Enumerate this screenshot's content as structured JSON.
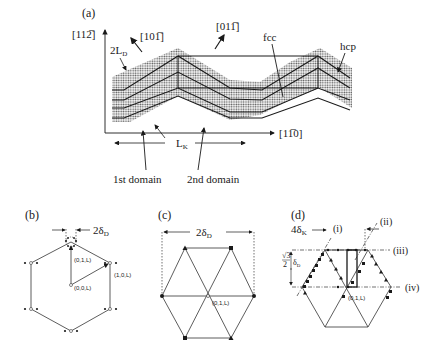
{
  "figure": {
    "panel_a": {
      "label": "(a)",
      "axis_y": "[11ŷ2]",
      "axis_y_display": "[112̅]",
      "axis_x_display": "[11̅0]",
      "dir_10_1": "[101̅]",
      "dir_01_1": "[011̅]",
      "label_2LD": "2L",
      "label_2LD_sub": "D",
      "label_fcc": "fcc",
      "label_hcp": "hcp",
      "label_LK": "L",
      "label_LK_sub": "K",
      "label_1st": "1st domain",
      "label_2nd": "2nd domain",
      "colors": {
        "band": "#8a8a8a",
        "line": "#1a1a1a"
      }
    },
    "panel_b": {
      "label": "(b)",
      "width_label": "2δ",
      "width_sub": "D",
      "points": [
        "(0,1,L)",
        "(1,0,L)",
        "(0,0,L)"
      ]
    },
    "panel_c": {
      "label": "(c)",
      "width_label": "2δ",
      "width_sub": "D",
      "point": "(0,1,L)"
    },
    "panel_d": {
      "label": "(d)",
      "label_4dK": "4δ",
      "label_4dK_sub": "K",
      "label_sqrt3": "√3",
      "label_sqrt3_den": "2",
      "label_sqrt3_delta": "δ",
      "label_sqrt3_sub": "D",
      "lines": [
        "(i)",
        "(ii)",
        "(iii)",
        "(iv)"
      ],
      "point": "(0,1,L)"
    }
  }
}
